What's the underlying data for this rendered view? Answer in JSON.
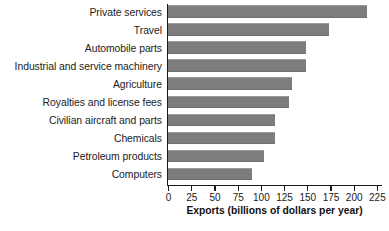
{
  "chart_data": {
    "type": "bar",
    "orientation": "horizontal",
    "title": "",
    "xlabel": "Exports (billions of dollars per year)",
    "ylabel": "",
    "xlim": [
      0,
      225
    ],
    "xticks": [
      0,
      25,
      50,
      75,
      100,
      125,
      150,
      175,
      200,
      225
    ],
    "xtick_labels": [
      "0",
      "25",
      "50",
      "75",
      "100",
      "125",
      "150",
      "175",
      "200",
      "225"
    ],
    "grid": false,
    "legend": false,
    "bar_color": "#7d7d7d",
    "axis_color": "#1a1a1a",
    "categories": [
      "Private services",
      "Travel",
      "Automobile parts",
      "Industrial and service machinery",
      "Agriculture",
      "Royalties and license fees",
      "Civilian aircraft and parts",
      "Chemicals",
      "Petroleum products",
      "Computers"
    ],
    "values": [
      214,
      173,
      149,
      149,
      134,
      130,
      115,
      115,
      103,
      91
    ]
  }
}
